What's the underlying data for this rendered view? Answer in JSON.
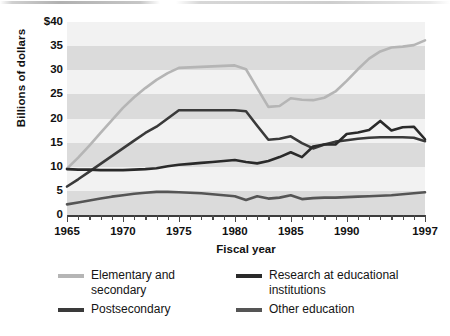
{
  "chart_data": {
    "type": "line",
    "title": "",
    "xlabel": "Fiscal year",
    "ylabel": "Billions of dollars",
    "xlim": [
      1965,
      1997
    ],
    "ylim": [
      0,
      40
    ],
    "ytick_labels": [
      "$40",
      "35",
      "30",
      "25",
      "20",
      "15",
      "10",
      "5",
      "0"
    ],
    "ytick_values": [
      40,
      35,
      30,
      25,
      20,
      15,
      10,
      5,
      0
    ],
    "xtick_labels": [
      "1965",
      "1970",
      "1975",
      "1980",
      "1985",
      "1990",
      "1997"
    ],
    "xtick_values": [
      1965,
      1970,
      1975,
      1980,
      1985,
      1990,
      1997
    ],
    "minor_ticks_every": 1,
    "grid": "alternating horizontal bands every 5 units",
    "legend_position": "below plot, two columns",
    "x": [
      1965,
      1966,
      1967,
      1968,
      1969,
      1970,
      1971,
      1972,
      1973,
      1974,
      1975,
      1976,
      1977,
      1978,
      1979,
      1980,
      1981,
      1982,
      1983,
      1984,
      1985,
      1986,
      1987,
      1988,
      1989,
      1990,
      1991,
      1992,
      1993,
      1994,
      1995,
      1996,
      1997
    ],
    "series": [
      {
        "name": "Elementary and secondary",
        "color": "#b5b5b5",
        "values": [
          9.6,
          11.9,
          14.4,
          17.0,
          19.6,
          22.2,
          24.4,
          26.3,
          28.0,
          29.4,
          30.5,
          30.6,
          30.7,
          30.8,
          30.9,
          31.0,
          30.2,
          26.3,
          22.4,
          22.6,
          24.2,
          23.9,
          23.8,
          24.3,
          25.6,
          27.8,
          30.2,
          32.4,
          33.9,
          34.7,
          34.9,
          35.2,
          36.2
        ]
      },
      {
        "name": "Postsecondary",
        "color": "#3a3a3a",
        "values": [
          5.9,
          7.4,
          9.0,
          10.6,
          12.2,
          13.8,
          15.4,
          17.0,
          18.3,
          20.0,
          21.7,
          21.7,
          21.7,
          21.7,
          21.7,
          21.7,
          21.5,
          18.5,
          15.6,
          15.8,
          16.3,
          14.9,
          13.8,
          14.6,
          15.2,
          15.5,
          15.8,
          16.0,
          16.1,
          16.1,
          16.1,
          16.0,
          15.3
        ]
      },
      {
        "name": "Research at educational institutions",
        "color": "#2a2a2a",
        "values": [
          9.5,
          9.4,
          9.4,
          9.3,
          9.3,
          9.3,
          9.4,
          9.5,
          9.7,
          10.1,
          10.4,
          10.6,
          10.8,
          11.0,
          11.2,
          11.4,
          11.0,
          10.7,
          11.2,
          12.0,
          13.0,
          12.0,
          14.2,
          14.6,
          14.6,
          16.8,
          17.1,
          17.6,
          19.5,
          17.5,
          18.2,
          18.3,
          15.7
        ]
      },
      {
        "name": "Other education",
        "color": "#555555",
        "values": [
          2.2,
          2.6,
          3.0,
          3.4,
          3.8,
          4.1,
          4.4,
          4.6,
          4.8,
          4.8,
          4.7,
          4.6,
          4.5,
          4.3,
          4.1,
          3.9,
          3.1,
          3.9,
          3.4,
          3.6,
          4.1,
          3.3,
          3.5,
          3.6,
          3.6,
          3.7,
          3.8,
          3.9,
          4.0,
          4.1,
          4.3,
          4.5,
          4.7
        ]
      }
    ]
  },
  "legend": {
    "items": [
      {
        "label": "Elementary and\nsecondary",
        "color": "#b5b5b5"
      },
      {
        "label": "Research at educational\ninstitutions",
        "color": "#2a2a2a"
      },
      {
        "label": "Postsecondary",
        "color": "#3a3a3a"
      },
      {
        "label": "Other education",
        "color": "#555555"
      }
    ]
  },
  "bands": {
    "dark_color": "#dbdbdb",
    "light_color": "#f2f2f2"
  }
}
